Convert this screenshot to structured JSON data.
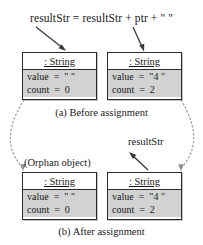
{
  "figure": {
    "expression": "resultStr = resultStr + ptr + \" \"",
    "panels": [
      {
        "id": "before",
        "caption": "(a) Before assignment",
        "objects": [
          {
            "id": "before-left",
            "type_label": ": String",
            "attributes": [
              {
                "name": "value",
                "text": "value  =  \" \""
              },
              {
                "name": "count",
                "text": "count  =  0"
              }
            ]
          },
          {
            "id": "before-right",
            "type_label": ": String",
            "attributes": [
              {
                "name": "value",
                "text": "value  =  \"4 \""
              },
              {
                "name": "count",
                "text": "count  =  2"
              }
            ]
          }
        ]
      },
      {
        "id": "after",
        "caption": "(b) After assignment",
        "orphan_label": "(Orphan object)",
        "pointer_label": "resultStr",
        "objects": [
          {
            "id": "after-left",
            "type_label": ": String",
            "attributes": [
              {
                "name": "value",
                "text": "value  =  \" \""
              },
              {
                "name": "count",
                "text": "count  =  0"
              }
            ]
          },
          {
            "id": "after-right",
            "type_label": ": String",
            "attributes": [
              {
                "name": "value",
                "text": "value  =  \"4 \""
              },
              {
                "name": "count",
                "text": "count  =  2"
              }
            ]
          }
        ]
      }
    ],
    "colors": {
      "box_border": "#2b2b2b",
      "header_fill": "#ffffff",
      "body_fill": "#d2d2d2",
      "arrow": "#3a3a3a",
      "dotted_connector": "#9a9a9a",
      "text": "#1a1a1a",
      "background": "#ffffff"
    }
  }
}
